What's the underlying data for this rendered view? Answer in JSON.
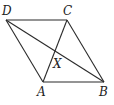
{
  "figure": {
    "type": "parallelogram-diagram",
    "points": {
      "D": {
        "label": "D",
        "x": 6,
        "y": 20,
        "lx": 2,
        "ly": 15
      },
      "C": {
        "label": "C",
        "x": 67,
        "y": 20,
        "lx": 63,
        "ly": 15
      },
      "A": {
        "label": "A",
        "x": 43,
        "y": 82,
        "lx": 37,
        "ly": 96
      },
      "B": {
        "label": "B",
        "x": 104,
        "y": 82,
        "lx": 99,
        "ly": 96
      },
      "X": {
        "label": "X",
        "x": 55,
        "y": 55,
        "lx": 53,
        "ly": 68
      }
    },
    "segments": [
      [
        "D",
        "C"
      ],
      [
        "C",
        "B"
      ],
      [
        "B",
        "A"
      ],
      [
        "A",
        "D"
      ],
      [
        "D",
        "B"
      ],
      [
        "A",
        "C"
      ]
    ]
  }
}
